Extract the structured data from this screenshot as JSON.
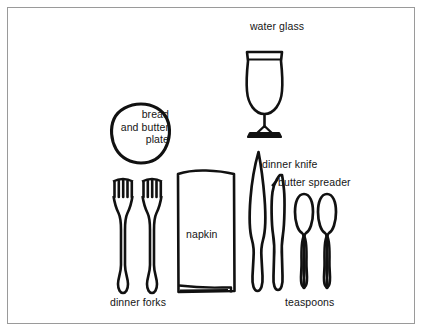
{
  "illustration": {
    "title": "formal place setting diagram",
    "background_color": "#ffffff",
    "ink_color": "#111111",
    "border_color": "#9a9a9a"
  },
  "labels": {
    "bread_and_butter_plate": "bread\nand butter\nplate",
    "water_glass": "water glass",
    "dinner_knife": "dinner knife",
    "butter_spreader": "butter spreader",
    "napkin": "napkin",
    "dinner_forks": "dinner forks",
    "teaspoons": "teaspoons"
  },
  "items": [
    {
      "name": "bread-and-butter-plate",
      "label": "bread and butter plate",
      "count": 1
    },
    {
      "name": "water-glass",
      "label": "water glass",
      "count": 1
    },
    {
      "name": "dinner-fork",
      "label": "dinner forks",
      "count": 2
    },
    {
      "name": "napkin",
      "label": "napkin",
      "count": 1
    },
    {
      "name": "dinner-knife",
      "label": "dinner knife",
      "count": 1
    },
    {
      "name": "butter-spreader",
      "label": "butter spreader",
      "count": 1
    },
    {
      "name": "teaspoon",
      "label": "teaspoons",
      "count": 2
    }
  ]
}
